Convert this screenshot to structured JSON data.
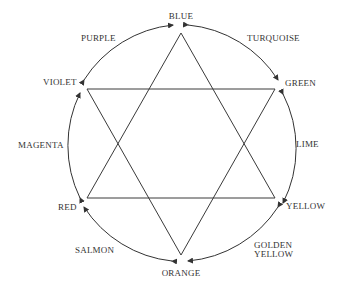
{
  "diagram": {
    "colors": {
      "line": "#333333",
      "background": "#ffffff"
    },
    "vertex_labels": {
      "blue": "BLUE",
      "green": "GREEN",
      "yellow": "YELLOW",
      "orange": "ORANGE",
      "red": "RED",
      "violet": "VIOLET"
    },
    "arc_labels": {
      "turquoise": "TURQUOISE",
      "lime": "LIME",
      "golden_yellow_1": "GOLDEN",
      "golden_yellow_2": "YELLOW",
      "salmon": "SALMON",
      "magenta": "MAGENTA",
      "purple": "PURPLE"
    },
    "triangles": [
      {
        "name": "blue-red-yellow",
        "vertices": [
          "BLUE",
          "RED",
          "YELLOW"
        ]
      },
      {
        "name": "orange-violet-green",
        "vertices": [
          "ORANGE",
          "VIOLET",
          "GREEN"
        ]
      }
    ]
  }
}
